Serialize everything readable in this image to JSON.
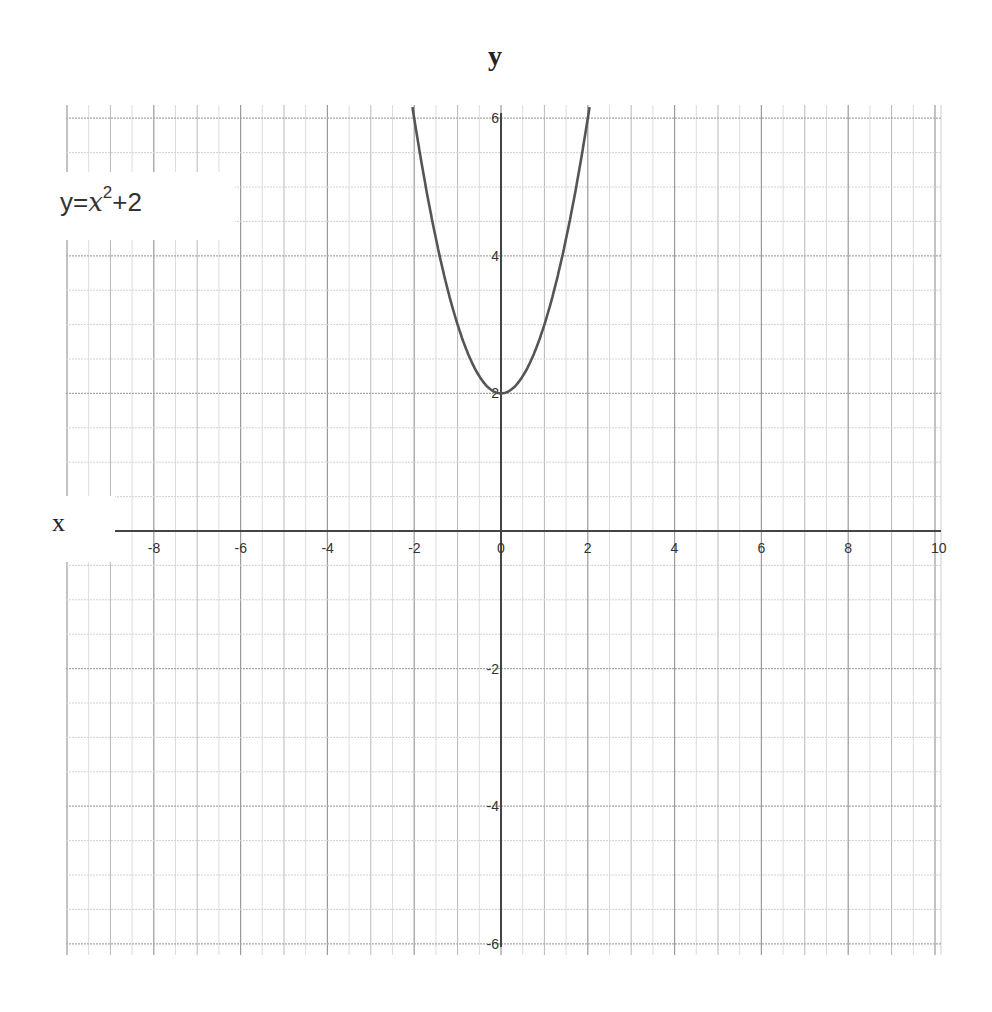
{
  "chart_data": {
    "type": "line",
    "title": "",
    "function": "y = x^2 + 2",
    "annotation": {
      "prefix": "y=",
      "variable": "x",
      "exponent": "2",
      "suffix": "+2"
    },
    "xlabel": "x",
    "ylabel": "y",
    "xlim": [
      -10,
      10.1
    ],
    "ylim": [
      -6.2,
      6.2
    ],
    "x_ticks": [
      -8,
      -6,
      -4,
      -2,
      0,
      2,
      4,
      6,
      8,
      10
    ],
    "y_ticks": [
      -6,
      -4,
      -2,
      2,
      4,
      6
    ],
    "grid": true,
    "grid_minor_step": 0.5,
    "series": [
      {
        "name": "y=x^2+2",
        "color": "#555555",
        "x": [
          -2.04,
          -1.5,
          -1,
          -0.5,
          0,
          0.5,
          1,
          1.5,
          2.04
        ],
        "y": [
          6.16,
          4.25,
          3,
          2.25,
          2,
          2.25,
          3,
          4.25,
          6.16
        ]
      }
    ],
    "layout": {
      "origin_px": [
        501,
        531
      ],
      "unit_x_px": 43.4,
      "unit_y_px": 68.8,
      "grid_box_px": [
        66,
        105,
        941,
        955
      ]
    }
  }
}
